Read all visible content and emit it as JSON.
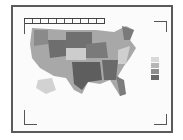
{
  "figure": {
    "type": "us-choropleth-map",
    "legend": {
      "title": "",
      "swatches": [
        "#d9d9d9",
        "#b5b5b5",
        "#8e8e8e",
        "#6a6a6a"
      ]
    },
    "colors": {
      "frame": "#5a5a5a",
      "light": "#d6d6d6",
      "mid": "#a8a8a8",
      "dark": "#6e6e6e",
      "darkest": "#575757"
    }
  }
}
